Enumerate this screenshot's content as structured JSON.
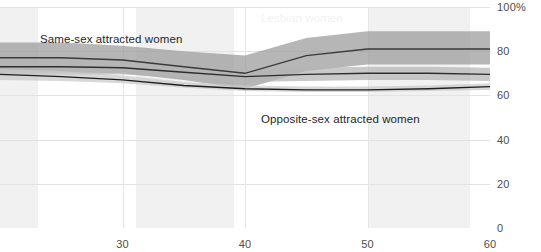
{
  "chart_data": {
    "type": "line",
    "title": "",
    "xlabel": "",
    "ylabel": "",
    "xlim": [
      20,
      60
    ],
    "ylim": [
      0,
      100
    ],
    "x_ticks": [
      30,
      40,
      50,
      60
    ],
    "y_ticks": [
      "0",
      "20",
      "40",
      "60",
      "80",
      "100%"
    ],
    "y_tick_values": [
      0,
      20,
      40,
      60,
      80,
      100
    ],
    "grid": true,
    "legend_position": "inline-annotations",
    "x": [
      20,
      25,
      30,
      35,
      40,
      45,
      50,
      55,
      60
    ],
    "series": [
      {
        "name": "Lesbian women",
        "label_color": "#f2f2f2",
        "line_color": "#3a3a3a",
        "band_color": "#9a9a9a",
        "values": [
          77,
          77,
          76,
          73,
          70,
          78,
          81,
          81,
          81
        ],
        "band_low": [
          70,
          70.5,
          70,
          67,
          63,
          71,
          74,
          74,
          74
        ],
        "band_high": [
          84,
          84,
          82.5,
          80,
          78,
          86,
          89,
          89,
          89
        ]
      },
      {
        "name": "Same-sex attracted women",
        "label_color": "#23272b",
        "line_color": "#2e2e2e",
        "band_color": "#b4b4b4",
        "values": [
          73,
          73,
          72.5,
          70.5,
          68.5,
          69.5,
          70,
          70,
          69.5
        ],
        "band_low": [
          69,
          69.5,
          69.5,
          68,
          66,
          66.5,
          67,
          67,
          66.5
        ],
        "band_high": [
          77,
          77,
          76,
          73.5,
          71.5,
          72.5,
          73,
          73,
          72.5
        ]
      },
      {
        "name": "Opposite-sex attracted women",
        "label_color": "#23272b",
        "line_color": "#1e1e1e",
        "band_color": "#c9c9c9",
        "values": [
          69.5,
          68.5,
          67,
          64.5,
          63,
          62.5,
          62.5,
          63,
          64
        ],
        "band_low": [
          67,
          66.5,
          65.5,
          63.5,
          62,
          61.5,
          61.5,
          62,
          62.5
        ],
        "band_high": [
          72,
          71,
          69,
          66,
          64.5,
          64,
          64,
          64.5,
          65.5
        ]
      }
    ],
    "annotations": [
      {
        "text": "Lesbian women",
        "x_px": 261,
        "y_px": 12,
        "style": "light"
      },
      {
        "text": "Same-sex attracted women",
        "x_px": 40,
        "y_px": 33,
        "style": "dark"
      },
      {
        "text": "Opposite-sex attracted women",
        "x_px": 261,
        "y_px": 113,
        "style": "dark"
      }
    ],
    "background_bands": [
      {
        "x0_px": 0,
        "x1_px": 38
      },
      {
        "x0_px": 136,
        "x1_px": 234
      },
      {
        "x0_px": 368,
        "x1_px": 470
      }
    ]
  }
}
